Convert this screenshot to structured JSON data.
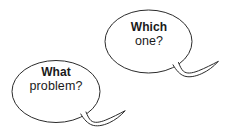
{
  "scene": {
    "title": "Two speech bubbles asking questions",
    "background_color": "#ffffff",
    "stroke_color": "#2b2b2b",
    "fill_color": "#ffffff",
    "text_color": "#1a1a1a",
    "width": 234,
    "height": 132
  },
  "bubbles": [
    {
      "id": "which-one",
      "position": "top-right",
      "line1": "Which",
      "line2": "one?",
      "line1_weight": "bold",
      "line2_weight": "regular",
      "tail_direction": "right"
    },
    {
      "id": "what-problem",
      "position": "bottom-left",
      "line1": "What",
      "line2": "problem?",
      "line1_weight": "bold",
      "line2_weight": "regular",
      "tail_direction": "right"
    }
  ]
}
